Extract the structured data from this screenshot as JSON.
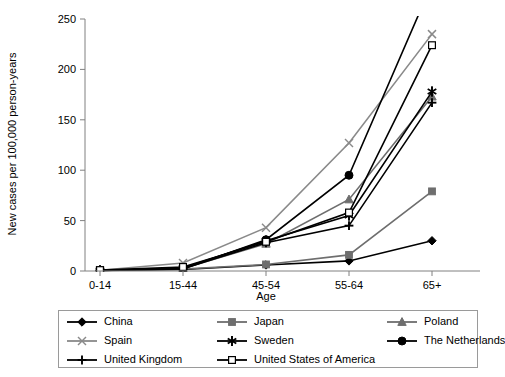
{
  "chart_data": {
    "type": "line",
    "title": "",
    "xlabel": "Age",
    "ylabel": "New cases per 100,000 person-years",
    "categories": [
      "0-14",
      "15-44",
      "45-54",
      "55-64",
      "65+"
    ],
    "xticklabels": [
      "0-14",
      "15-44",
      "45-54",
      "55-64",
      "65+"
    ],
    "yticklabels": [
      "0",
      "50",
      "100",
      "150",
      "200",
      "250"
    ],
    "ylim": [
      0,
      250
    ],
    "ytick_step": 50,
    "grid": false,
    "legend_position": "below-plot",
    "clipped_above_axis_max": true,
    "series": [
      {
        "name": "China",
        "marker": "filled-diamond",
        "color": "#000000",
        "values": [
          0.6,
          1.5,
          6.0,
          10.0,
          30.0
        ]
      },
      {
        "name": "Japan",
        "marker": "filled-square",
        "color": "#6e6e6e",
        "values": [
          0.5,
          2.0,
          6.5,
          16.0,
          79.0
        ]
      },
      {
        "name": "Poland",
        "marker": "filled-triangle",
        "color": "#6e6e6e",
        "values": [
          0.5,
          2.5,
          27.0,
          71.0,
          173.0
        ]
      },
      {
        "name": "Spain",
        "marker": "cross-x",
        "color": "#8a8a8a",
        "values": [
          0.8,
          8.0,
          43.0,
          127.0,
          235.0
        ]
      },
      {
        "name": "Sweden",
        "marker": "asterisk",
        "color": "#000000",
        "values": [
          0.8,
          3.0,
          30.0,
          55.0,
          178.0
        ]
      },
      {
        "name": "The Netherlands",
        "marker": "filled-circle",
        "color": "#000000",
        "values": [
          0.7,
          2.0,
          31.0,
          95.0,
          285.0
        ]
      },
      {
        "name": "United Kingdom",
        "marker": "plus",
        "color": "#000000",
        "values": [
          0.6,
          2.2,
          28.0,
          45.0,
          167.0
        ]
      },
      {
        "name": "United States of America",
        "marker": "open-square",
        "color": "#000000",
        "values": [
          0.9,
          4.0,
          29.0,
          58.0,
          224.0
        ]
      }
    ]
  },
  "legend": {
    "items": [
      {
        "label": "China"
      },
      {
        "label": "Japan"
      },
      {
        "label": "Poland"
      },
      {
        "label": "Spain"
      },
      {
        "label": "Sweden"
      },
      {
        "label": "The Netherlands"
      },
      {
        "label": "United Kingdom"
      },
      {
        "label": "United States of America"
      }
    ]
  }
}
